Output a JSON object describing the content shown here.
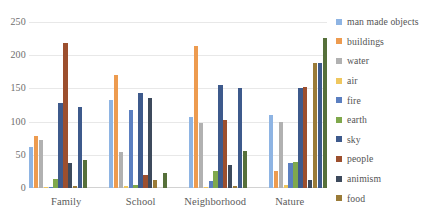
{
  "chart_data": {
    "type": "bar",
    "title": "",
    "xlabel": "",
    "ylabel": "",
    "ylim": [
      0,
      250
    ],
    "y_ticks": [
      250,
      200,
      150,
      100,
      50,
      0
    ],
    "grid": true,
    "legend_position": "right",
    "categories": [
      "Family",
      "School",
      "Neighborhood",
      "Nature"
    ],
    "series": [
      {
        "name": "man made objects",
        "color": "#8eb4e3",
        "values": [
          62,
          132,
          107,
          110
        ]
      },
      {
        "name": "buildings",
        "color": "#ed9b4f",
        "values": [
          78,
          170,
          214,
          25
        ]
      },
      {
        "name": "water",
        "color": "#b1b1b1",
        "values": [
          72,
          54,
          98,
          99
        ]
      },
      {
        "name": "air",
        "color": "#efc75e",
        "values": [
          1,
          3,
          1,
          4
        ]
      },
      {
        "name": "fire",
        "color": "#5b7fc0",
        "values": [
          1,
          118,
          10,
          38
        ]
      },
      {
        "name": "earth",
        "color": "#7fa84c",
        "values": [
          14,
          4,
          26,
          39
        ]
      },
      {
        "name": "sky",
        "color": "#3e5a8c",
        "values": [
          128,
          143,
          155,
          151
        ]
      },
      {
        "name": "people",
        "color": "#9c4f2e",
        "values": [
          219,
          20,
          102,
          152
        ]
      },
      {
        "name": "animism",
        "color": "#3d4a5c",
        "values": [
          38,
          136,
          34,
          12
        ]
      },
      {
        "name": "food",
        "color": "#9a7b38",
        "values": [
          3,
          12,
          3,
          188
        ]
      },
      {
        "name": "sky-2",
        "color": "#3e5a8c",
        "values": [
          122,
          0,
          151,
          188
        ]
      },
      {
        "name": "earth-2",
        "color": "#56703a",
        "values": [
          42,
          23,
          55,
          226
        ]
      }
    ]
  },
  "legend": {
    "items": [
      {
        "label": "man made objects",
        "color": "#8eb4e3"
      },
      {
        "label": "buildings",
        "color": "#ed9b4f"
      },
      {
        "label": "water",
        "color": "#b1b1b1"
      },
      {
        "label": "air",
        "color": "#efc75e"
      },
      {
        "label": "fire",
        "color": "#5b7fc0"
      },
      {
        "label": "earth",
        "color": "#7fa84c"
      },
      {
        "label": "sky",
        "color": "#3e5a8c"
      },
      {
        "label": "people",
        "color": "#9c4f2e"
      },
      {
        "label": "animism",
        "color": "#3d4a5c"
      },
      {
        "label": "food",
        "color": "#9a7b38"
      }
    ]
  },
  "bars": {
    "Family": [
      62,
      78,
      72,
      1,
      1,
      14,
      128,
      219,
      38,
      3,
      122,
      42
    ],
    "School": [
      132,
      170,
      54,
      3,
      118,
      4,
      143,
      20,
      136,
      12,
      0,
      23
    ],
    "Neighborhood": [
      107,
      214,
      98,
      1,
      10,
      26,
      155,
      102,
      34,
      3,
      151,
      55
    ],
    "Nature": [
      110,
      25,
      99,
      4,
      38,
      39,
      151,
      152,
      12,
      188,
      0,
      226
    ]
  },
  "bar_colors": [
    "#8eb4e3",
    "#ed9b4f",
    "#b1b1b1",
    "#efc75e",
    "#5b7fc0",
    "#7fa84c",
    "#3e5a8c",
    "#9c4f2e",
    "#3d4a5c",
    "#9a7b38",
    "#3e5a8c",
    "#56703a"
  ]
}
